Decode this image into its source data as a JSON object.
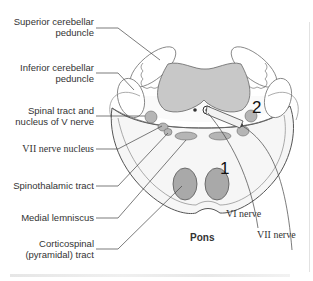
{
  "diagram": {
    "title": "Pons",
    "labels_left": [
      {
        "id": "superior-cerebellar-peduncle",
        "lines": [
          "Superior cerebellar",
          "peduncle"
        ]
      },
      {
        "id": "inferior-cerebellar-peduncle",
        "lines": [
          "Inferior cerebellar",
          "peduncle"
        ]
      },
      {
        "id": "spinal-tract-nucleus-v",
        "lines": [
          "Spinal tract and",
          "nucleus of V nerve"
        ]
      },
      {
        "id": "vii-nerve-nucleus",
        "lines": [
          "VII nerve nucleus"
        ]
      },
      {
        "id": "spinothalamic-tract",
        "lines": [
          "Spinothalamic tract"
        ]
      },
      {
        "id": "medial-lemniscus",
        "lines": [
          "Medial lemniscus"
        ]
      },
      {
        "id": "corticospinal-tract",
        "lines": [
          "Corticospinal",
          "(pyramidal) tract"
        ]
      }
    ],
    "labels_right": [
      {
        "id": "vi-nerve",
        "text": "VI nerve"
      },
      {
        "id": "vii-nerve",
        "text": "VII nerve"
      }
    ],
    "markers": [
      {
        "id": "marker-1",
        "text": "1"
      },
      {
        "id": "marker-2",
        "text": "2"
      }
    ],
    "colors": {
      "fill_dark": "#a9a9a9",
      "fill_light": "#c4c4c4",
      "outline": "#666666",
      "body_fill": "#f4f4f4",
      "leader": "#444444"
    }
  }
}
